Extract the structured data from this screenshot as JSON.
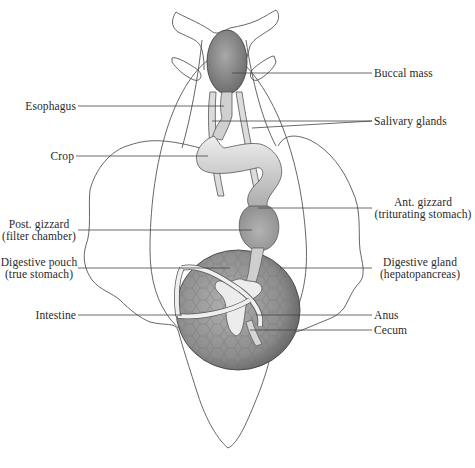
{
  "diagram": {
    "colors": {
      "outline": "#555555",
      "leader_line": "#444444",
      "organ_dark": "#8a8a8a",
      "organ_mid": "#b5b5b5",
      "organ_light": "#e6e6e6",
      "background": "#ffffff",
      "text": "#2a2a2a"
    },
    "labels": {
      "buccal_mass": "Buccal mass",
      "esophagus": "Esophagus",
      "salivary_glands": "Salivary glands",
      "crop": "Crop",
      "ant_gizzard_1": "Ant. gizzard",
      "ant_gizzard_2": "(triturating stomach)",
      "post_gizzard_1": "Post. gizzard",
      "post_gizzard_2": "(filter chamber)",
      "digestive_pouch_1": "Digestive pouch",
      "digestive_pouch_2": "(true stomach)",
      "digestive_gland_1": "Digestive gland",
      "digestive_gland_2": "(hepatopancreas)",
      "intestine": "Intestine",
      "anus": "Anus",
      "cecum": "Cecum"
    }
  }
}
